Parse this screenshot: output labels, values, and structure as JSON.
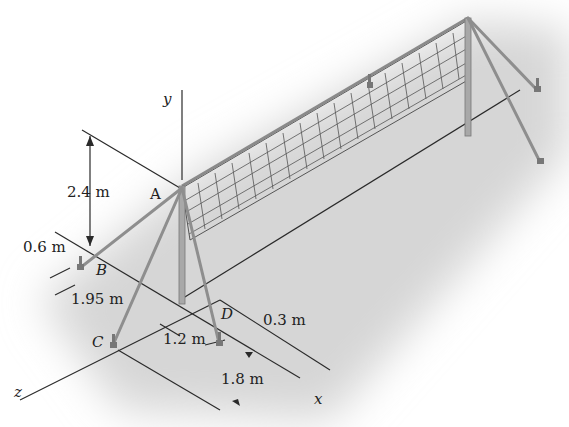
{
  "figure": {
    "points": {
      "A": "A",
      "B": "B",
      "C": "C",
      "D": "D"
    },
    "axes": {
      "x": "x",
      "y": "y",
      "z": "z"
    },
    "dimensions": {
      "height_A": "2.4 m",
      "offset_B": "0.6 m",
      "dist_B": "1.95 m",
      "dist_CD": "1.2 m",
      "offset_D": "0.3 m",
      "dist_C": "1.8 m"
    },
    "colors": {
      "shadow": "#d8d8d8",
      "post": "#9a9a9a",
      "line": "#2a2a2a",
      "net": "#555555"
    }
  }
}
